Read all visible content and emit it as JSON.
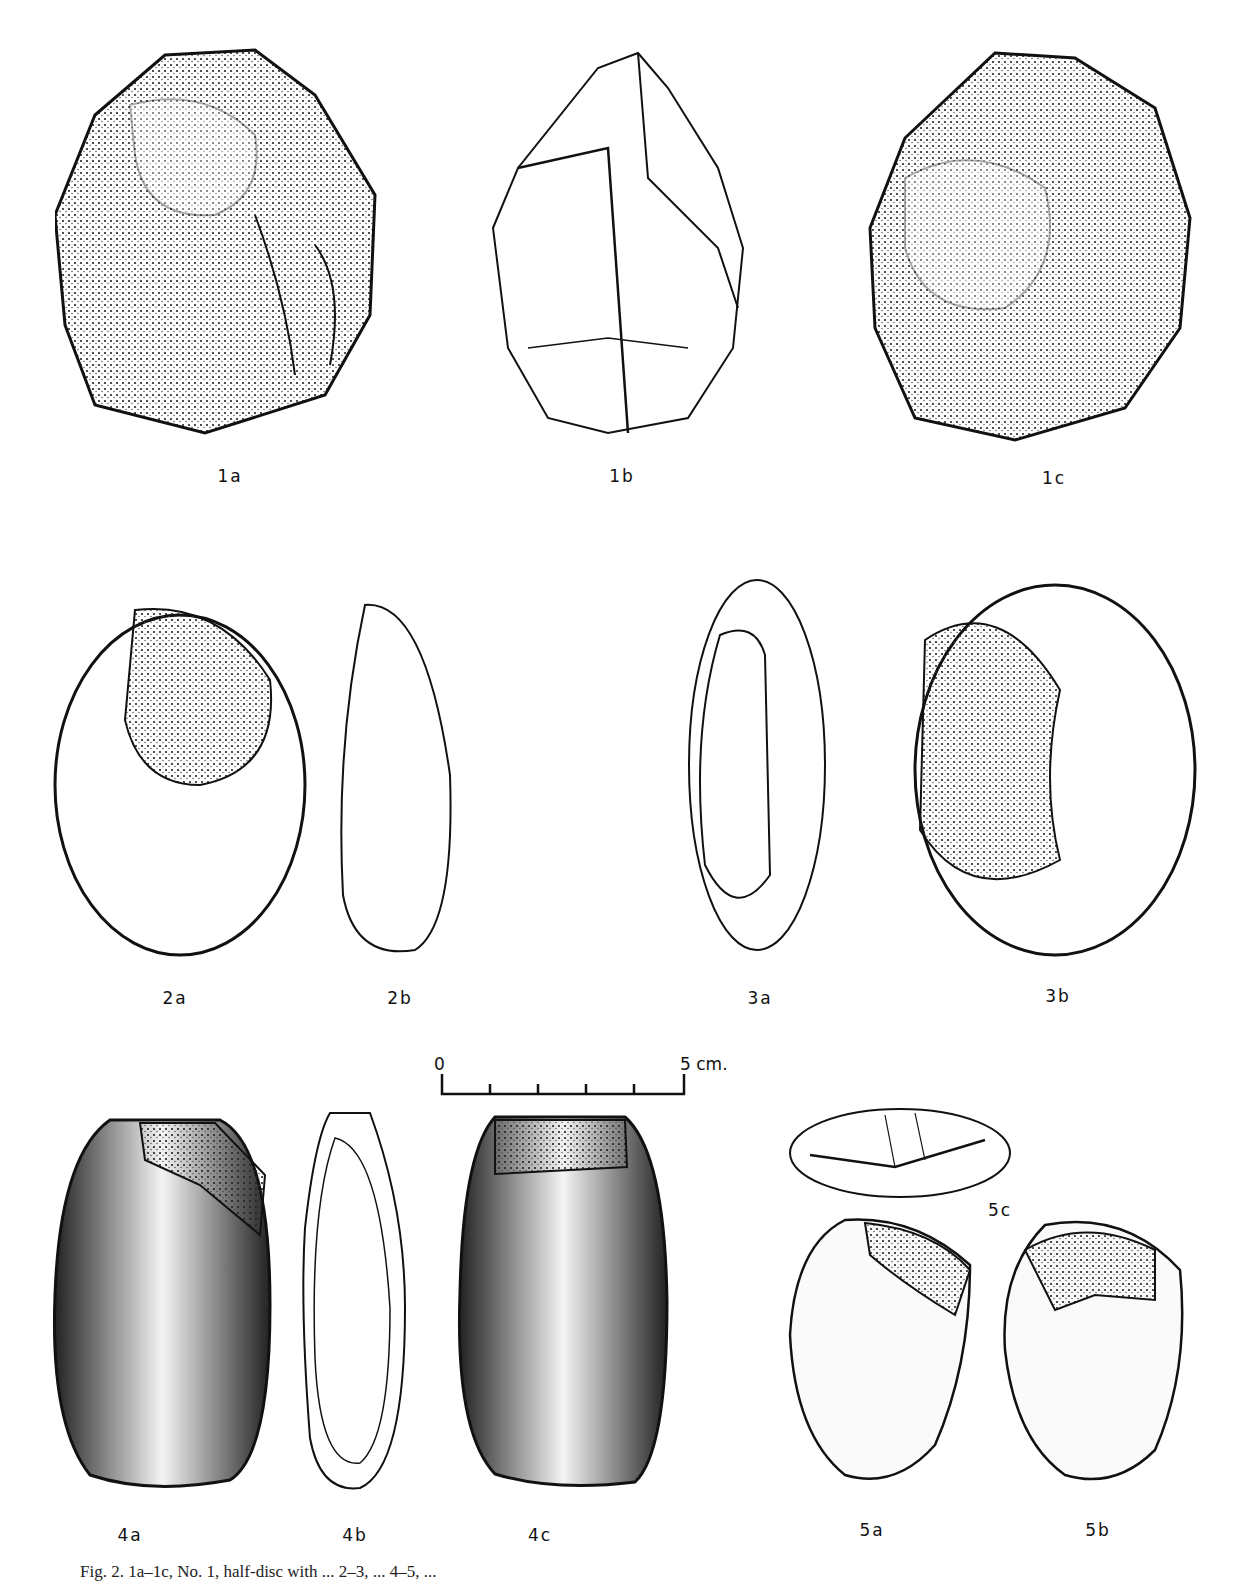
{
  "labels": {
    "l1a": "1a",
    "l1b": "1b",
    "l1c": "1c",
    "l2a": "2a",
    "l2b": "2b",
    "l3a": "3a",
    "l3b": "3b",
    "l4a": "4a",
    "l4b": "4b",
    "l4c": "4c",
    "l5a": "5a",
    "l5b": "5b",
    "l5c": "5c"
  },
  "scale": {
    "start": "0",
    "end": "5 cm."
  },
  "caption": "Fig. 2. 1a–1c, No. 1, half-disc with ... 2–3, ... 4–5, ... "
}
